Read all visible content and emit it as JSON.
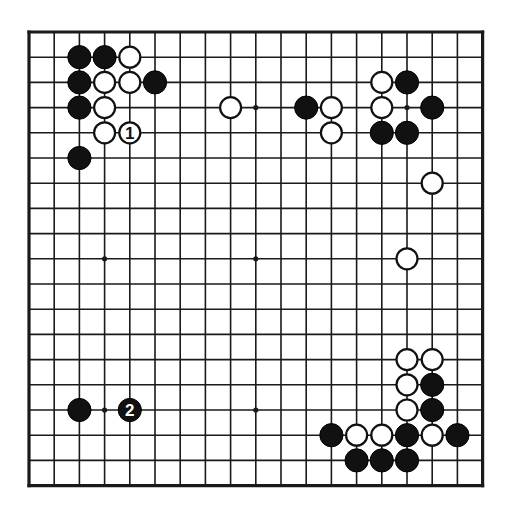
{
  "diagram": {
    "kind": "go-board-diagram",
    "board_size": 19,
    "geometry": {
      "origin_x": 29,
      "origin_y": 32,
      "spacing": 25.2,
      "stone_radius": 11.6,
      "line_width": 1.6,
      "border_width": 3.2,
      "star_radius": 2.6
    },
    "colors": {
      "background": "#ffffff",
      "line": "#1a1a1a",
      "black_stone": "#111111",
      "white_stone": "#ffffff",
      "white_stone_outline": "#111111",
      "label_on_white": "#111111",
      "label_on_black": "#ffffff"
    },
    "star_points": [
      {
        "col": 3,
        "row": 3
      },
      {
        "col": 9,
        "row": 3
      },
      {
        "col": 15,
        "row": 3
      },
      {
        "col": 3,
        "row": 9
      },
      {
        "col": 9,
        "row": 9
      },
      {
        "col": 15,
        "row": 9
      },
      {
        "col": 3,
        "row": 15
      },
      {
        "col": 9,
        "row": 15
      },
      {
        "col": 15,
        "row": 15
      }
    ],
    "stones": [
      {
        "col": 2,
        "row": 1,
        "color": "black",
        "label": ""
      },
      {
        "col": 3,
        "row": 1,
        "color": "black",
        "label": ""
      },
      {
        "col": 4,
        "row": 1,
        "color": "white",
        "label": ""
      },
      {
        "col": 2,
        "row": 2,
        "color": "black",
        "label": ""
      },
      {
        "col": 3,
        "row": 2,
        "color": "white",
        "label": ""
      },
      {
        "col": 4,
        "row": 2,
        "color": "white",
        "label": ""
      },
      {
        "col": 5,
        "row": 2,
        "color": "black",
        "label": ""
      },
      {
        "col": 2,
        "row": 3,
        "color": "black",
        "label": ""
      },
      {
        "col": 3,
        "row": 3,
        "color": "white",
        "label": ""
      },
      {
        "col": 3,
        "row": 4,
        "color": "white",
        "label": ""
      },
      {
        "col": 4,
        "row": 4,
        "color": "white",
        "label": "1"
      },
      {
        "col": 2,
        "row": 5,
        "color": "black",
        "label": ""
      },
      {
        "col": 8,
        "row": 3,
        "color": "white",
        "label": ""
      },
      {
        "col": 11,
        "row": 3,
        "color": "black",
        "label": ""
      },
      {
        "col": 12,
        "row": 3,
        "color": "white",
        "label": ""
      },
      {
        "col": 12,
        "row": 4,
        "color": "white",
        "label": ""
      },
      {
        "col": 14,
        "row": 2,
        "color": "white",
        "label": ""
      },
      {
        "col": 15,
        "row": 2,
        "color": "black",
        "label": ""
      },
      {
        "col": 14,
        "row": 3,
        "color": "white",
        "label": ""
      },
      {
        "col": 16,
        "row": 3,
        "color": "black",
        "label": ""
      },
      {
        "col": 14,
        "row": 4,
        "color": "black",
        "label": ""
      },
      {
        "col": 15,
        "row": 4,
        "color": "black",
        "label": ""
      },
      {
        "col": 16,
        "row": 6,
        "color": "white",
        "label": ""
      },
      {
        "col": 15,
        "row": 9,
        "color": "white",
        "label": ""
      },
      {
        "col": 2,
        "row": 15,
        "color": "black",
        "label": ""
      },
      {
        "col": 4,
        "row": 15,
        "color": "black",
        "label": "2"
      },
      {
        "col": 15,
        "row": 13,
        "color": "white",
        "label": ""
      },
      {
        "col": 16,
        "row": 13,
        "color": "white",
        "label": ""
      },
      {
        "col": 15,
        "row": 14,
        "color": "white",
        "label": ""
      },
      {
        "col": 16,
        "row": 14,
        "color": "black",
        "label": ""
      },
      {
        "col": 15,
        "row": 15,
        "color": "white",
        "label": ""
      },
      {
        "col": 16,
        "row": 15,
        "color": "black",
        "label": ""
      },
      {
        "col": 12,
        "row": 16,
        "color": "black",
        "label": ""
      },
      {
        "col": 13,
        "row": 16,
        "color": "white",
        "label": ""
      },
      {
        "col": 14,
        "row": 16,
        "color": "white",
        "label": ""
      },
      {
        "col": 15,
        "row": 16,
        "color": "black",
        "label": ""
      },
      {
        "col": 16,
        "row": 16,
        "color": "white",
        "label": ""
      },
      {
        "col": 17,
        "row": 16,
        "color": "black",
        "label": ""
      },
      {
        "col": 13,
        "row": 17,
        "color": "black",
        "label": ""
      },
      {
        "col": 14,
        "row": 17,
        "color": "black",
        "label": ""
      },
      {
        "col": 15,
        "row": 17,
        "color": "black",
        "label": ""
      }
    ],
    "move_markers": [
      {
        "number": "1",
        "color": "white",
        "col": 4,
        "row": 4
      },
      {
        "number": "2",
        "color": "black",
        "col": 4,
        "row": 15
      }
    ]
  }
}
